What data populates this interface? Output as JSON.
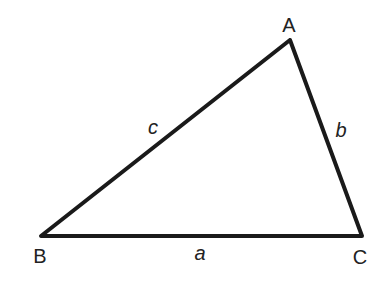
{
  "diagram": {
    "type": "triangle",
    "stroke_color": "#1a1a1a",
    "vertices": [
      {
        "name": "A",
        "x": 290,
        "y": 40,
        "label": "A",
        "label_x": 289,
        "label_y": 32
      },
      {
        "name": "B",
        "x": 41,
        "y": 236,
        "label": "B",
        "label_x": 40,
        "label_y": 263
      },
      {
        "name": "C",
        "x": 362,
        "y": 236,
        "label": "C",
        "label_x": 360,
        "label_y": 264
      }
    ],
    "sides": [
      {
        "name": "a",
        "from": "B",
        "to": "C",
        "label": "a",
        "label_x": 200,
        "label_y": 260
      },
      {
        "name": "b",
        "from": "A",
        "to": "C",
        "label": "b",
        "label_x": 341,
        "label_y": 137
      },
      {
        "name": "c",
        "from": "B",
        "to": "A",
        "label": "c",
        "label_x": 153,
        "label_y": 134
      }
    ]
  }
}
